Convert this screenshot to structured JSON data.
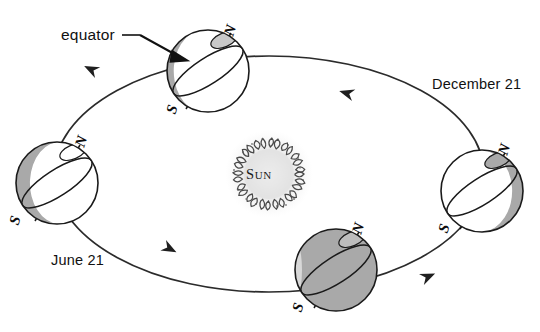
{
  "figure": {
    "type": "seasons-earth-orbit-diagram",
    "background_color": "#ffffff",
    "width": 540,
    "height": 332
  },
  "labels": {
    "equator": "equator",
    "december": "December 21",
    "june": "June 21"
  },
  "sun": {
    "name_cap": "S",
    "name_rest": "UN",
    "full_name": "Sun",
    "center_x": 269,
    "center_y": 174,
    "core_radius": 26,
    "corona_radius": 40,
    "core_color": "#d8d8d8",
    "corona_color": "#6b6b6b"
  },
  "colors": {
    "outline": "#1a1a1a",
    "shadow_fill": "#a9a9a9",
    "lit_fill": "#ffffff",
    "cap_fill": "#c9c9c9",
    "orbit_stroke": "#2b2b2b",
    "text": "#111111"
  },
  "orbit": {
    "center_x": 269,
    "center_y": 174,
    "radius_x": 215,
    "radius_y": 118,
    "direction": "counterclockwise",
    "arrow_count": 4
  },
  "earths": [
    {
      "id": "earth-top",
      "position": "top",
      "season_label": "",
      "center_x": 208,
      "center_y": 71,
      "radius": 41,
      "axis_tilt_deg": -23.5,
      "north_label": "N",
      "south_label": "S",
      "shaded_side": "upper-left",
      "shadow_fraction": 0.45
    },
    {
      "id": "earth-left",
      "position": "left",
      "season_label": "June 21",
      "center_x": 57,
      "center_y": 183,
      "radius": 41,
      "axis_tilt_deg": -23.5,
      "north_label": "N",
      "south_label": "S",
      "shaded_side": "left",
      "shadow_fraction": 0.55
    },
    {
      "id": "earth-bottom",
      "position": "bottom",
      "season_label": "",
      "center_x": 336,
      "center_y": 270,
      "radius": 41,
      "axis_tilt_deg": -23.5,
      "north_label": "N",
      "south_label": "S",
      "shaded_side": "most",
      "shadow_fraction": 0.85
    },
    {
      "id": "earth-right",
      "position": "right",
      "season_label": "December 21",
      "center_x": 482,
      "center_y": 191,
      "radius": 41,
      "axis_tilt_deg": -23.5,
      "north_label": "N",
      "south_label": "S",
      "shaded_side": "right",
      "shadow_fraction": 0.45
    }
  ]
}
